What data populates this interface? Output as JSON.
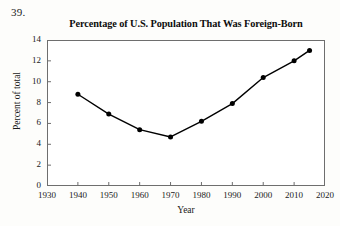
{
  "item_number": "39.",
  "chart_data": {
    "type": "line",
    "title": "Percentage of U.S. Population That Was Foreign-Born",
    "xlabel": "Year",
    "ylabel": "Percent of total",
    "grid": false,
    "legend": "none",
    "marker": "filled-circle",
    "line_color": "#000000",
    "marker_color": "#000000",
    "xlim": [
      1930,
      2020
    ],
    "ylim": [
      0,
      14
    ],
    "xticks": [
      1930,
      1940,
      1950,
      1960,
      1970,
      1980,
      1990,
      2000,
      2010,
      2020
    ],
    "yticks": [
      0,
      2,
      4,
      6,
      8,
      10,
      12,
      14
    ],
    "xtick_labels": [
      "1930",
      "1940",
      "1950",
      "1960",
      "1970",
      "1980",
      "1990",
      "2000",
      "2010",
      "2020"
    ],
    "ytick_labels": [
      "0",
      "2",
      "4",
      "6",
      "8",
      "10",
      "12",
      "14"
    ],
    "x": [
      1940,
      1950,
      1960,
      1970,
      1980,
      1990,
      2000,
      2010,
      2015
    ],
    "values": [
      8.8,
      6.9,
      5.4,
      4.7,
      6.2,
      7.9,
      10.4,
      12.0,
      13.0
    ],
    "points": [
      {
        "x": 1940,
        "y": 8.8
      },
      {
        "x": 1950,
        "y": 6.9
      },
      {
        "x": 1960,
        "y": 5.4
      },
      {
        "x": 1970,
        "y": 4.7
      },
      {
        "x": 1980,
        "y": 6.2
      },
      {
        "x": 1990,
        "y": 7.9
      },
      {
        "x": 2000,
        "y": 10.4
      },
      {
        "x": 2010,
        "y": 12.0
      },
      {
        "x": 2015,
        "y": 13.0
      }
    ]
  }
}
